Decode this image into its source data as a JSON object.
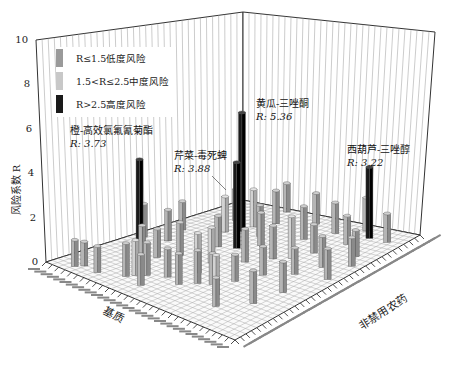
{
  "chart_data": {
    "type": "bar3d",
    "title": "",
    "xlabel": "基质",
    "ylabel": "非禁用农药",
    "zlabel": "风险系数 R",
    "zlim": [
      0,
      10
    ],
    "z_ticks": [
      "0",
      "2",
      "4",
      "6",
      "8",
      "10"
    ],
    "grid": true,
    "legend_position": "upper-left",
    "legend": [
      {
        "label": "R≤1.5低度风险",
        "color": "#9a9a9a"
      },
      {
        "label": "1.5<R≤2.5中度风险",
        "color": "#c8c8c8"
      },
      {
        "label": "R>2.5高度风险",
        "color": "#1a1a1a"
      }
    ],
    "annotations": [
      {
        "name": "橙-高效氯氟氰菊酯",
        "value": "R: 3.73"
      },
      {
        "name": "芹菜-毒死蜱",
        "value": "R: 3.88"
      },
      {
        "name": "黄瓜-三唑酮",
        "value": "R: 5.36"
      },
      {
        "name": "西葫芦-三唑醇",
        "value": "R: 3.22"
      }
    ],
    "high_risk_bars": [
      {
        "matrix": "橙",
        "pesticide": "高效氯氟氰菊酯",
        "R": 3.73
      },
      {
        "matrix": "芹菜",
        "pesticide": "毒死蜱",
        "R": 3.88
      },
      {
        "matrix": "黄瓜",
        "pesticide": "三唑酮",
        "R": 5.36
      },
      {
        "matrix": "西葫芦",
        "pesticide": "三唑醇",
        "R": 3.22
      }
    ],
    "bars": [
      {
        "u": 0.05,
        "v": 0.1,
        "R": 1.2
      },
      {
        "u": 0.08,
        "v": 0.12,
        "R": 1.1
      },
      {
        "u": 0.07,
        "v": 0.2,
        "R": 1.2
      },
      {
        "u": 0.12,
        "v": 0.3,
        "R": 1.5
      },
      {
        "u": 0.15,
        "v": 0.32,
        "R": 1.6
      },
      {
        "u": 0.18,
        "v": 0.35,
        "R": 1.5
      },
      {
        "u": 0.1,
        "v": 0.4,
        "R": 1.4
      },
      {
        "u": 0.22,
        "v": 0.42,
        "R": 1.3
      },
      {
        "u": 0.2,
        "v": 0.5,
        "R": 1.4
      },
      {
        "u": 0.25,
        "v": 0.55,
        "R": 1.5
      },
      {
        "u": 0.3,
        "v": 0.2,
        "R": 1.4
      },
      {
        "u": 0.33,
        "v": 0.25,
        "R": 1.3
      },
      {
        "u": 0.28,
        "v": 0.6,
        "R": 1.4
      },
      {
        "u": 0.35,
        "v": 0.65,
        "R": 1.2
      },
      {
        "u": 0.4,
        "v": 0.3,
        "R": 1.5
      },
      {
        "u": 0.42,
        "v": 0.45,
        "R": 1.6
      },
      {
        "u": 0.45,
        "v": 0.7,
        "R": 1.3
      },
      {
        "u": 0.48,
        "v": 0.15,
        "R": 1.4
      },
      {
        "u": 0.5,
        "v": 0.55,
        "R": 1.5
      },
      {
        "u": 0.52,
        "v": 0.8,
        "R": 1.2
      },
      {
        "u": 0.55,
        "v": 0.35,
        "R": 1.4
      },
      {
        "u": 0.58,
        "v": 0.62,
        "R": 1.5
      },
      {
        "u": 0.6,
        "v": 0.1,
        "R": 1.3
      },
      {
        "u": 0.62,
        "v": 0.85,
        "R": 1.4
      },
      {
        "u": 0.65,
        "v": 0.48,
        "R": 1.5
      },
      {
        "u": 0.68,
        "v": 0.25,
        "R": 1.6
      },
      {
        "u": 0.7,
        "v": 0.72,
        "R": 1.3
      },
      {
        "u": 0.72,
        "v": 0.4,
        "R": 1.4
      },
      {
        "u": 0.75,
        "v": 0.9,
        "R": 1.2
      },
      {
        "u": 0.78,
        "v": 0.58,
        "R": 1.5
      },
      {
        "u": 0.8,
        "v": 0.18,
        "R": 1.4
      },
      {
        "u": 0.82,
        "v": 0.78,
        "R": 1.3
      },
      {
        "u": 0.85,
        "v": 0.35,
        "R": 1.5
      },
      {
        "u": 0.88,
        "v": 0.65,
        "R": 1.4
      },
      {
        "u": 0.9,
        "v": 0.92,
        "R": 1.3
      },
      {
        "u": 0.92,
        "v": 0.5,
        "R": 1.4
      },
      {
        "u": 0.95,
        "v": 0.75,
        "R": 1.5
      },
      {
        "u": 0.97,
        "v": 0.28,
        "R": 1.3
      },
      {
        "u": 0.38,
        "v": 0.88,
        "R": 1.4
      },
      {
        "u": 0.15,
        "v": 0.75,
        "R": 1.3
      },
      {
        "u": 0.25,
        "v": 0.85,
        "R": 1.5
      },
      {
        "u": 0.55,
        "v": 0.95,
        "R": 1.4
      },
      {
        "u": 0.68,
        "v": 0.95,
        "R": 1.3
      },
      {
        "u": 0.45,
        "v": 0.05,
        "R": 1.5
      },
      {
        "u": 0.62,
        "v": 0.68,
        "R": 1.9
      },
      {
        "u": 0.32,
        "v": 0.48,
        "R": 1.8
      },
      {
        "u": 0.78,
        "v": 0.3,
        "R": 1.7
      },
      {
        "u": 0.22,
        "v": 0.68,
        "R": 1.8
      }
    ]
  }
}
